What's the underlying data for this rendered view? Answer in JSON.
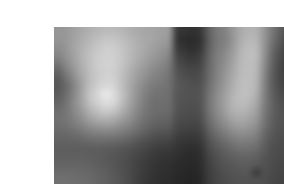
{
  "page": {
    "background_color": "#ffffff",
    "width": 284,
    "height": 184
  },
  "figure": {
    "name": "pixelated-grayscale-image",
    "alt_text": "Heavily pixelated grayscale image",
    "x": 14,
    "y": 11,
    "width": 254,
    "height": 157,
    "border": "none",
    "caption": ""
  },
  "chart_data": {
    "type": "heatmap",
    "title": "",
    "subtitle": "",
    "xlabel": "",
    "ylabel": "",
    "legend": [],
    "grid": false,
    "colormap": "grayscale",
    "value_range": [
      0,
      255
    ],
    "cols": 32,
    "rows": 20,
    "cell_width": 7.9375,
    "cell_height": 7.85,
    "smoothing": "bilinear",
    "xlim": [
      0,
      32
    ],
    "ylim": [
      0,
      20
    ],
    "xtick_labels": [],
    "ytick_labels": [],
    "annotations": [],
    "values": [
      [
        150,
        152,
        160,
        168,
        176,
        182,
        186,
        186,
        182,
        176,
        170,
        166,
        164,
        160,
        152,
        60,
        52,
        48,
        58,
        96,
        120,
        130,
        150,
        170,
        178,
        176,
        150,
        120,
        96,
        78,
        66,
        72
      ],
      [
        148,
        152,
        162,
        172,
        182,
        190,
        196,
        196,
        190,
        182,
        174,
        168,
        164,
        158,
        148,
        58,
        48,
        44,
        52,
        92,
        118,
        128,
        148,
        172,
        182,
        180,
        150,
        116,
        90,
        72,
        62,
        70
      ],
      [
        142,
        150,
        164,
        176,
        188,
        198,
        204,
        204,
        196,
        186,
        176,
        168,
        160,
        152,
        140,
        62,
        50,
        46,
        56,
        94,
        120,
        132,
        152,
        176,
        188,
        184,
        148,
        110,
        84,
        68,
        60,
        68
      ],
      [
        134,
        146,
        162,
        178,
        192,
        202,
        208,
        206,
        198,
        186,
        174,
        164,
        154,
        146,
        132,
        70,
        58,
        54,
        64,
        98,
        124,
        138,
        158,
        180,
        190,
        186,
        146,
        104,
        78,
        64,
        58,
        66
      ],
      [
        120,
        138,
        158,
        176,
        192,
        204,
        210,
        208,
        198,
        184,
        170,
        158,
        146,
        138,
        124,
        78,
        66,
        62,
        70,
        102,
        126,
        142,
        162,
        182,
        190,
        184,
        142,
        100,
        74,
        62,
        58,
        66
      ],
      [
        104,
        126,
        150,
        172,
        190,
        202,
        208,
        206,
        194,
        178,
        162,
        150,
        138,
        130,
        118,
        84,
        74,
        70,
        76,
        104,
        128,
        146,
        166,
        184,
        190,
        182,
        138,
        96,
        72,
        60,
        58,
        68
      ],
      [
        92,
        114,
        140,
        166,
        188,
        202,
        210,
        208,
        192,
        174,
        156,
        142,
        130,
        124,
        114,
        88,
        80,
        76,
        80,
        106,
        130,
        150,
        170,
        186,
        190,
        180,
        134,
        94,
        72,
        62,
        60,
        72
      ],
      [
        88,
        106,
        132,
        162,
        190,
        206,
        216,
        212,
        192,
        170,
        150,
        134,
        122,
        118,
        112,
        90,
        84,
        80,
        84,
        110,
        134,
        154,
        174,
        188,
        190,
        178,
        132,
        94,
        74,
        66,
        64,
        78
      ],
      [
        92,
        108,
        134,
        164,
        196,
        214,
        226,
        220,
        196,
        170,
        146,
        128,
        116,
        114,
        110,
        88,
        84,
        82,
        86,
        114,
        138,
        158,
        178,
        190,
        188,
        174,
        130,
        96,
        78,
        70,
        70,
        84
      ],
      [
        100,
        114,
        138,
        164,
        192,
        210,
        222,
        216,
        192,
        166,
        142,
        124,
        112,
        110,
        108,
        86,
        82,
        80,
        86,
        116,
        140,
        160,
        180,
        188,
        184,
        168,
        128,
        98,
        82,
        74,
        74,
        88
      ],
      [
        108,
        118,
        136,
        156,
        180,
        196,
        206,
        200,
        180,
        158,
        136,
        120,
        110,
        108,
        106,
        84,
        80,
        78,
        84,
        114,
        138,
        158,
        176,
        182,
        176,
        160,
        124,
        98,
        84,
        78,
        78,
        90
      ],
      [
        112,
        118,
        130,
        146,
        164,
        176,
        182,
        176,
        162,
        146,
        128,
        114,
        106,
        102,
        100,
        80,
        76,
        74,
        80,
        110,
        132,
        150,
        166,
        172,
        166,
        152,
        120,
        96,
        84,
        80,
        80,
        90
      ],
      [
        110,
        114,
        122,
        132,
        144,
        152,
        156,
        152,
        142,
        132,
        118,
        106,
        98,
        94,
        92,
        74,
        70,
        68,
        74,
        102,
        122,
        138,
        152,
        158,
        154,
        142,
        114,
        94,
        84,
        80,
        80,
        88
      ],
      [
        104,
        106,
        110,
        116,
        124,
        128,
        130,
        128,
        122,
        114,
        104,
        94,
        86,
        82,
        80,
        66,
        62,
        60,
        66,
        92,
        110,
        124,
        136,
        142,
        140,
        130,
        106,
        88,
        80,
        78,
        78,
        84
      ],
      [
        98,
        98,
        100,
        102,
        106,
        108,
        108,
        106,
        102,
        96,
        88,
        80,
        74,
        70,
        68,
        58,
        54,
        52,
        58,
        82,
        98,
        110,
        120,
        126,
        124,
        118,
        98,
        84,
        78,
        76,
        76,
        80
      ],
      [
        94,
        94,
        94,
        94,
        94,
        94,
        92,
        90,
        86,
        82,
        76,
        70,
        64,
        60,
        58,
        52,
        48,
        46,
        52,
        74,
        88,
        98,
        106,
        112,
        112,
        106,
        92,
        80,
        76,
        74,
        74,
        78
      ],
      [
        96,
        96,
        96,
        96,
        94,
        92,
        90,
        86,
        82,
        76,
        70,
        64,
        58,
        54,
        52,
        48,
        44,
        42,
        48,
        68,
        80,
        90,
        96,
        100,
        100,
        96,
        86,
        78,
        74,
        72,
        72,
        76
      ],
      [
        100,
        100,
        100,
        100,
        98,
        94,
        90,
        86,
        80,
        74,
        66,
        60,
        54,
        50,
        48,
        44,
        42,
        40,
        46,
        64,
        76,
        84,
        88,
        92,
        92,
        88,
        82,
        76,
        72,
        70,
        70,
        74
      ],
      [
        106,
        106,
        106,
        104,
        102,
        98,
        94,
        88,
        82,
        74,
        66,
        58,
        52,
        48,
        46,
        42,
        40,
        38,
        44,
        62,
        72,
        80,
        84,
        86,
        86,
        84,
        80,
        74,
        70,
        68,
        68,
        72
      ],
      [
        112,
        112,
        110,
        108,
        106,
        100,
        96,
        90,
        82,
        74,
        64,
        56,
        50,
        46,
        44,
        40,
        38,
        36,
        42,
        60,
        70,
        76,
        80,
        82,
        82,
        80,
        78,
        72,
        68,
        66,
        66,
        70
      ]
    ],
    "overlay_patches": [
      {
        "name": "bright-highlight-upper-left",
        "col": 6,
        "row": 8,
        "value": 232
      },
      {
        "name": "dark-block-top-center",
        "col": 16,
        "row": 1,
        "value": 44
      },
      {
        "name": "dark-patch-upper-right",
        "col": 30,
        "row": 2,
        "value": 58
      },
      {
        "name": "light-band-center-right",
        "col": 24,
        "row": 8,
        "value": 190
      },
      {
        "name": "dark-square-bottom-right",
        "col": 25,
        "row": 18,
        "value": 62
      }
    ]
  }
}
